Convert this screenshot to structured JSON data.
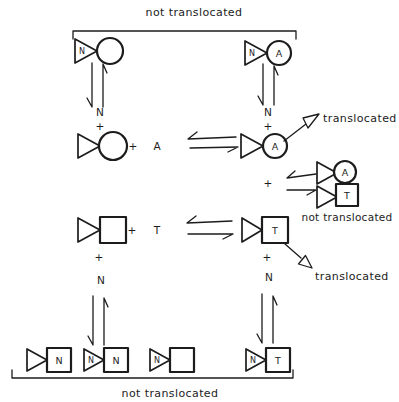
{
  "figure": {
    "background": "#ffffff",
    "ink_color": "#1c1c1c",
    "top_bracket": {
      "label": "not translocated"
    },
    "bottom_bracket": {
      "label": "not translocated"
    },
    "annotations": {
      "translocated_upper": "translocated",
      "translocated_lower": "translocated",
      "complex_not_translocated": "not translocated"
    },
    "symbols": {
      "plus": "+",
      "nucleotide": "N",
      "ligand_a": "A",
      "ligand_t": "T"
    },
    "molecules": {
      "top_left": {
        "triangle_label": "N",
        "body": "circle",
        "body_label": ""
      },
      "top_right": {
        "triangle_label": "N",
        "body": "circle",
        "body_label": "A"
      },
      "mid_left_circle": {
        "triangle_label": "",
        "body": "circle",
        "body_label": ""
      },
      "mid_right_circle": {
        "triangle_label": "",
        "body": "circle",
        "body_label": "A"
      },
      "complex_top": {
        "triangle_label": "",
        "body": "circle",
        "body_label": "A"
      },
      "complex_bottom": {
        "triangle_label": "",
        "body": "square",
        "body_label": "T"
      },
      "mid_left_square": {
        "triangle_label": "",
        "body": "square",
        "body_label": ""
      },
      "mid_right_square": {
        "triangle_label": "",
        "body": "square",
        "body_label": "T"
      },
      "bottom_1": {
        "triangle_label": "",
        "body": "square",
        "body_label": "N"
      },
      "bottom_2": {
        "triangle_label": "N",
        "body": "square",
        "body_label": "N"
      },
      "bottom_3": {
        "triangle_label": "N",
        "body": "square",
        "body_label": ""
      },
      "bottom_right": {
        "triangle_label": "N",
        "body": "square",
        "body_label": "T"
      }
    }
  }
}
